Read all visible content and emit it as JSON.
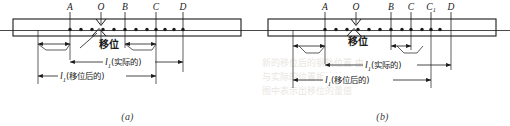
{
  "figure": {
    "panels": [
      {
        "id": "a",
        "caption": "(a)",
        "point_labels": [
          "A",
          "O",
          "B",
          "C",
          "D"
        ],
        "displacement_label": "移位",
        "dimensions": [
          {
            "id": "l-actual",
            "text": "l",
            "subscript": "1",
            "qualifier": "(实际的)"
          },
          {
            "id": "l-displaced",
            "text": "l",
            "subscript": "1",
            "qualifier": "(移位后的)"
          }
        ],
        "tie_count": 14
      },
      {
        "id": "b",
        "caption": "(b)",
        "point_labels": [
          "A",
          "O",
          "B",
          "C",
          "C",
          "D"
        ],
        "point_label_subscripts": [
          "",
          "",
          "",
          "",
          "1",
          ""
        ],
        "displacement_label": "移位",
        "dimensions": [
          {
            "id": "l-actual",
            "text": "l",
            "subscript": "1",
            "qualifier": "(实际的)"
          },
          {
            "id": "l-displaced",
            "text": "l",
            "subscript": "1",
            "qualifier": "(移位后的)"
          }
        ],
        "tie_count": 14
      }
    ],
    "colors": {
      "ink": "#1a1a1a",
      "paper": "#ffffff",
      "rule": "#4a4a4a",
      "ghost": "#e9e6e2"
    }
  },
  "ghost_text": {
    "line1": "新的移位后的钢轨位置 由此",
    "line2": "与实际的位置相比较",
    "line3": "图中表示出移位的量值"
  }
}
